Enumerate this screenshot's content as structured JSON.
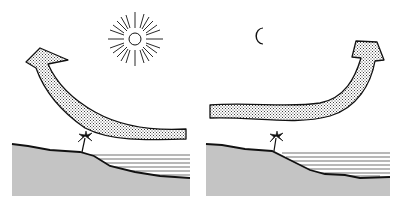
{
  "diagram": {
    "type": "sea-breeze-land-breeze-illustration",
    "panels": [
      {
        "id": "day",
        "celestial_body": "sun-icon",
        "wind_arrow": "arrow-from-sea-rising-over-land",
        "direction": "sea-to-land"
      },
      {
        "id": "night",
        "celestial_body": "crescent-moon-icon",
        "wind_arrow": "arrow-from-land-rising-over-sea",
        "direction": "land-to-sea"
      }
    ],
    "colors": {
      "ink": "#111111",
      "land_fill": "#bdbdbd",
      "background": "#ffffff"
    }
  }
}
